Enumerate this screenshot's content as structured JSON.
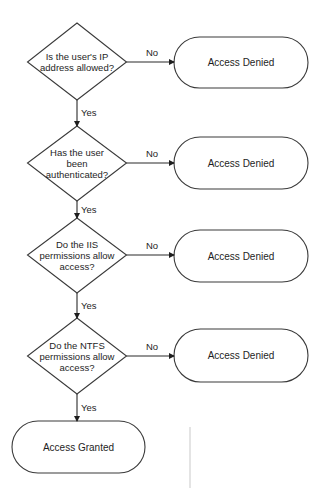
{
  "diagram": {
    "type": "flowchart",
    "decisions": [
      {
        "id": "ip-check",
        "lines": [
          "Is the user's IP",
          "address allowed?"
        ]
      },
      {
        "id": "auth-check",
        "lines": [
          "Has the user",
          "been",
          "authenticated?"
        ]
      },
      {
        "id": "iis-check",
        "lines": [
          "Do the IIS",
          "permissions allow",
          "access?"
        ]
      },
      {
        "id": "ntfs-check",
        "lines": [
          "Do the NTFS",
          "permissions allow",
          "access?"
        ]
      }
    ],
    "denied_terminals": [
      {
        "id": "denied-1",
        "label": "Access Denied"
      },
      {
        "id": "denied-2",
        "label": "Access Denied"
      },
      {
        "id": "denied-3",
        "label": "Access Denied"
      },
      {
        "id": "denied-4",
        "label": "Access Denied"
      }
    ],
    "granted_terminal": {
      "id": "granted",
      "label": "Access Granted"
    },
    "edges": [
      {
        "from": "ip-check",
        "to": "denied-1",
        "label": "No"
      },
      {
        "from": "ip-check",
        "to": "auth-check",
        "label": "Yes"
      },
      {
        "from": "auth-check",
        "to": "denied-2",
        "label": "No"
      },
      {
        "from": "auth-check",
        "to": "iis-check",
        "label": "Yes"
      },
      {
        "from": "iis-check",
        "to": "denied-3",
        "label": "No"
      },
      {
        "from": "iis-check",
        "to": "ntfs-check",
        "label": "Yes"
      },
      {
        "from": "ntfs-check",
        "to": "denied-4",
        "label": "No"
      },
      {
        "from": "ntfs-check",
        "to": "granted",
        "label": "Yes"
      }
    ],
    "labels": {
      "yes": "Yes",
      "no": "No"
    }
  }
}
